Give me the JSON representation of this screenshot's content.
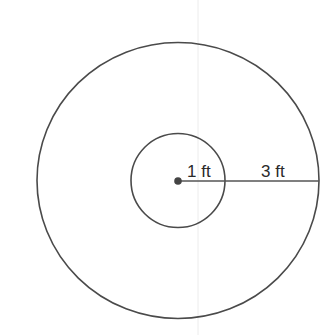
{
  "figure": {
    "inner_circle": {
      "radius_label": "1 ft"
    },
    "outer_circle": {
      "radius_label": "3 ft"
    },
    "colors": {
      "stroke": "#4a4a4a",
      "text": "#2a2a2a",
      "guide": "#e6e6e6"
    }
  }
}
